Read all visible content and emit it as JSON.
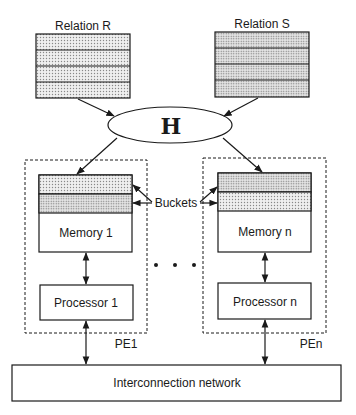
{
  "diagram": {
    "type": "parallel-hash-join-architecture",
    "relations": [
      {
        "label": "Relation R",
        "rows": 4
      },
      {
        "label": "Relation S",
        "rows": 4
      }
    ],
    "hash_function": {
      "label": "H"
    },
    "buckets_label": "Buckets",
    "processing_elements": [
      {
        "pe_label": "PE1",
        "memory_label": "Memory 1",
        "processor_label": "Processor 1",
        "bucket_rows": 2
      },
      {
        "pe_label": "PEn",
        "memory_label": "Memory n",
        "processor_label": "Processor n",
        "bucket_rows": 2
      }
    ],
    "ellipsis": "• • •",
    "network": {
      "label": "Interconnection network"
    },
    "edges": [
      {
        "from": "Relation R",
        "to": "H"
      },
      {
        "from": "Relation S",
        "to": "H"
      },
      {
        "from": "H",
        "to": "Memory 1"
      },
      {
        "from": "H",
        "to": "Memory n"
      },
      {
        "from": "Memory 1",
        "to": "Processor 1",
        "bidirectional": true
      },
      {
        "from": "Memory n",
        "to": "Processor n",
        "bidirectional": true
      },
      {
        "from": "Processor 1",
        "to": "Interconnection network",
        "bidirectional": true
      },
      {
        "from": "Processor n",
        "to": "Interconnection network",
        "bidirectional": true
      },
      {
        "from": "Buckets",
        "to": "Memory 1 buckets"
      },
      {
        "from": "Buckets",
        "to": "Memory n buckets"
      }
    ],
    "colors": {
      "stroke": "#1a1a1a",
      "fill_dotted": "#d8d8d8",
      "background": "#ffffff"
    }
  }
}
